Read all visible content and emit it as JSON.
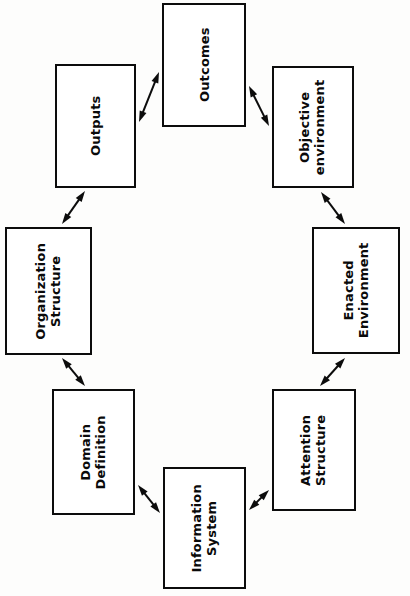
{
  "diagram": {
    "orientation": "rotated-90",
    "background_color": "#fdfdfc",
    "stroke_color": "#0c0c0c",
    "nodes": [
      {
        "id": "outcomes",
        "label": "Outcomes",
        "lines": [
          "Outcomes"
        ],
        "x": 162,
        "y": 3,
        "w": 84,
        "h": 124
      },
      {
        "id": "objective-environment",
        "label": "Objective environment",
        "lines": [
          "Objective",
          "environment"
        ],
        "x": 272,
        "y": 66,
        "w": 82,
        "h": 122
      },
      {
        "id": "enacted-environment",
        "label": "Enacted Environment",
        "lines": [
          "Enacted",
          "Environment"
        ],
        "x": 312,
        "y": 227,
        "w": 88,
        "h": 127
      },
      {
        "id": "attention-structure",
        "label": "Attention Structure",
        "lines": [
          "Attention",
          "Structure"
        ],
        "x": 272,
        "y": 389,
        "w": 84,
        "h": 122
      },
      {
        "id": "information-system",
        "label": "Information System",
        "lines": [
          "Information",
          "System"
        ],
        "x": 163,
        "y": 467,
        "w": 83,
        "h": 122
      },
      {
        "id": "domain-definition",
        "label": "Domain Definition",
        "lines": [
          "Domain",
          "Definition"
        ],
        "x": 52,
        "y": 389,
        "w": 83,
        "h": 126
      },
      {
        "id": "organization-structure",
        "label": "Organization Structure",
        "lines": [
          "Organization",
          "Structure"
        ],
        "x": 5,
        "y": 227,
        "w": 87,
        "h": 128
      },
      {
        "id": "outputs",
        "label": "Outputs",
        "lines": [
          "Outputs"
        ],
        "x": 55,
        "y": 64,
        "w": 81,
        "h": 124
      }
    ],
    "edges": [
      {
        "id": "edge-outputs-outcomes",
        "from": "outputs",
        "to": "outcomes",
        "x1": 139,
        "y1": 122,
        "x2": 159,
        "y2": 72,
        "double": true
      },
      {
        "id": "edge-outcomes-objective",
        "from": "outcomes",
        "to": "objective-environment",
        "x1": 249,
        "y1": 86,
        "x2": 269,
        "y2": 126,
        "double": true
      },
      {
        "id": "edge-objective-enacted",
        "from": "objective-environment",
        "to": "enacted-environment",
        "x1": 321,
        "y1": 192,
        "x2": 345,
        "y2": 224,
        "double": true
      },
      {
        "id": "edge-enacted-attention",
        "from": "enacted-environment",
        "to": "attention-structure",
        "x1": 345,
        "y1": 358,
        "x2": 320,
        "y2": 386,
        "double": true
      },
      {
        "id": "edge-attention-information",
        "from": "attention-structure",
        "to": "information-system",
        "x1": 269,
        "y1": 490,
        "x2": 249,
        "y2": 510,
        "double": true
      },
      {
        "id": "edge-information-domain",
        "from": "information-system",
        "to": "domain-definition",
        "x1": 160,
        "y1": 513,
        "x2": 138,
        "y2": 485,
        "double": true
      },
      {
        "id": "edge-domain-organization",
        "from": "domain-definition",
        "to": "organization-structure",
        "x1": 85,
        "y1": 386,
        "x2": 62,
        "y2": 358,
        "double": true
      },
      {
        "id": "edge-organization-outputs",
        "from": "organization-structure",
        "to": "outputs",
        "x1": 62,
        "y1": 224,
        "x2": 85,
        "y2": 191,
        "double": true
      }
    ]
  }
}
